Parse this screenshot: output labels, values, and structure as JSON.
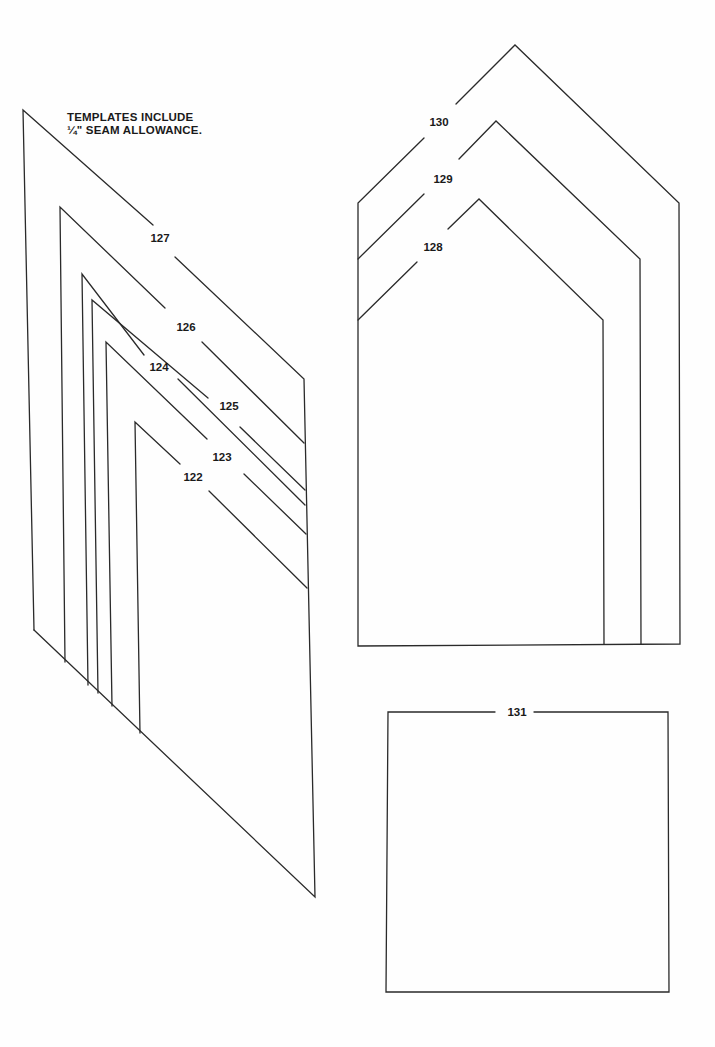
{
  "page": {
    "note": {
      "line1": "TEMPLATES INCLUDE",
      "line2": "¼\" SEAM ALLOWANCE."
    },
    "stroke_color": "#2a2a2a",
    "background_color": "#fefefe"
  },
  "left_group": {
    "description": "Nested slanted templates",
    "labels": [
      {
        "id": "127",
        "text": "127",
        "x": 160,
        "y": 238
      },
      {
        "id": "126",
        "text": "126",
        "x": 186,
        "y": 327
      },
      {
        "id": "124",
        "text": "124",
        "x": 159,
        "y": 367
      },
      {
        "id": "125",
        "text": "125",
        "x": 229,
        "y": 406
      },
      {
        "id": "123",
        "text": "123",
        "x": 222,
        "y": 457
      },
      {
        "id": "122",
        "text": "122",
        "x": 193,
        "y": 477
      }
    ]
  },
  "right_group": {
    "description": "Nested house-shaped templates",
    "labels": [
      {
        "id": "130",
        "text": "130",
        "x": 439,
        "y": 122
      },
      {
        "id": "129",
        "text": "129",
        "x": 443,
        "y": 179
      },
      {
        "id": "128",
        "text": "128",
        "x": 433,
        "y": 247
      }
    ]
  },
  "square_template": {
    "label": {
      "id": "131",
      "text": "131",
      "x": 517,
      "y": 712
    }
  }
}
